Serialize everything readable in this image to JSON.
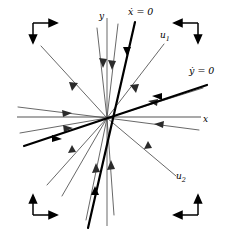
{
  "figure": {
    "kind": "phase-portrait",
    "title": "",
    "background_color": "#ffffff",
    "width": 230,
    "height": 236
  },
  "colors": {
    "axis": "#8c8c8c",
    "nullcline": "#000000",
    "trajectory": "#4d4d4d",
    "corner_arrow": "#000000",
    "label": "#000000"
  },
  "axes": {
    "origin": {
      "x": 107,
      "y": 118
    },
    "x_axis": {
      "label": "x",
      "x1": 17,
      "y1": 117,
      "x2": 201,
      "y2": 117,
      "label_x": 203,
      "label_y": 122
    },
    "y_axis": {
      "label": "y",
      "x1": 107,
      "y1": 18,
      "x2": 107,
      "y2": 226,
      "label_x": 100,
      "label_y": 19
    }
  },
  "nullclines": [
    {
      "name": "x-dot-nullcline",
      "label": "ẋ = 0",
      "label_x": 128,
      "label_y": 14,
      "x1": 135,
      "y1": 22,
      "x2": 88,
      "y2": 228
    },
    {
      "name": "y-dot-nullcline",
      "label": "ẏ = 0",
      "label_x": 189,
      "label_y": 73,
      "x1": 24,
      "y1": 146,
      "x2": 207,
      "y2": 85
    }
  ],
  "eigendirections": [
    {
      "name": "u1",
      "label": "u",
      "subscript": "1",
      "label_x": 160,
      "label_y": 37
    },
    {
      "name": "u2",
      "label": "u",
      "subscript": "2",
      "label_x": 176,
      "label_y": 178
    }
  ],
  "trajectories": [
    {
      "name": "traj-nw-long",
      "x1": 41,
      "y1": 46,
      "x2": 107,
      "y2": 118,
      "arrow_t": 0.52
    },
    {
      "name": "traj-ne-u1",
      "x1": 164,
      "y1": 44,
      "x2": 107,
      "y2": 118,
      "arrow_t": 0.55
    },
    {
      "name": "traj-se-u2",
      "x1": 176,
      "y1": 176,
      "x2": 107,
      "y2": 118,
      "arrow_t": 0.46
    },
    {
      "name": "traj-sw-lower",
      "x1": 47,
      "y1": 185,
      "x2": 107,
      "y2": 118,
      "arrow_t": 0.52
    },
    {
      "name": "traj-w-upper",
      "x1": 18,
      "y1": 107,
      "x2": 107,
      "y2": 118,
      "arrow_t": 0.58
    },
    {
      "name": "traj-w-lower",
      "x1": 20,
      "y1": 133,
      "x2": 107,
      "y2": 118,
      "arrow_t": 0.6
    },
    {
      "name": "traj-e-flat",
      "x1": 199,
      "y1": 130,
      "x2": 107,
      "y2": 118,
      "arrow_t": 0.5
    },
    {
      "name": "traj-e-upper",
      "x1": 203,
      "y1": 88,
      "x2": 107,
      "y2": 118,
      "arrow_t": 0.44
    },
    {
      "name": "traj-n-steep",
      "x1": 118,
      "y1": 24,
      "x2": 107,
      "y2": 118,
      "arrow_t": 0.47
    },
    {
      "name": "traj-n-left",
      "x1": 97,
      "y1": 28,
      "x2": 107,
      "y2": 118,
      "arrow_t": 0.46
    },
    {
      "name": "traj-s-left",
      "x1": 86,
      "y1": 220,
      "x2": 107,
      "y2": 118,
      "arrow_t": 0.52
    },
    {
      "name": "traj-s-right",
      "x1": 114,
      "y1": 215,
      "x2": 107,
      "y2": 118,
      "arrow_t": 0.52
    },
    {
      "name": "traj-sw-steep",
      "x1": 62,
      "y1": 196,
      "x2": 107,
      "y2": 118,
      "arrow_t": 0.48
    }
  ],
  "corner_arrows": [
    {
      "name": "corner-arrow-top-left",
      "position": "top-left",
      "corner_x": 33,
      "corner_y": 23,
      "h_dir": "right",
      "v_dir": "down"
    },
    {
      "name": "corner-arrow-top-right",
      "position": "top-right",
      "corner_x": 198,
      "corner_y": 23,
      "h_dir": "left",
      "v_dir": "down"
    },
    {
      "name": "corner-arrow-bottom-left",
      "position": "bottom-left",
      "corner_x": 33,
      "corner_y": 215,
      "h_dir": "right",
      "v_dir": "up"
    },
    {
      "name": "corner-arrow-bottom-right",
      "position": "bottom-right",
      "corner_x": 198,
      "corner_y": 215,
      "h_dir": "left",
      "v_dir": "up"
    }
  ]
}
